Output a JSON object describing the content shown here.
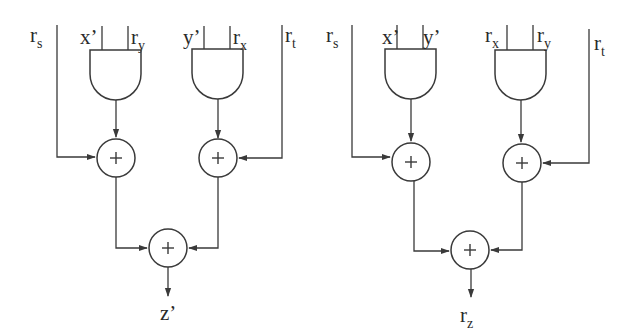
{
  "diagrams": [
    {
      "name": "left-circuit",
      "inputs": {
        "left_wire": {
          "base": "r",
          "sub": "s"
        },
        "gate1_a": {
          "base": "x’",
          "sub": ""
        },
        "gate1_b": {
          "base": "r",
          "sub": "y"
        },
        "gate2_a": {
          "base": "y’",
          "sub": ""
        },
        "gate2_b": {
          "base": "r",
          "sub": "x"
        },
        "right_wire": {
          "base": "r",
          "sub": "t"
        }
      },
      "adder_symbol": "+",
      "output": {
        "base": "z’",
        "sub": ""
      }
    },
    {
      "name": "right-circuit",
      "inputs": {
        "left_wire": {
          "base": "r",
          "sub": "s"
        },
        "gate1_a": {
          "base": "x’",
          "sub": ""
        },
        "gate1_b": {
          "base": "y’",
          "sub": ""
        },
        "gate2_a": {
          "base": "r",
          "sub": "x"
        },
        "gate2_b": {
          "base": "r",
          "sub": "y"
        },
        "right_wire": {
          "base": "r",
          "sub": "t"
        }
      },
      "adder_symbol": "+",
      "output": {
        "base": "r",
        "sub": "z"
      }
    }
  ],
  "colors": {
    "stroke": "#3a3a3a",
    "background": "#ffffff"
  }
}
